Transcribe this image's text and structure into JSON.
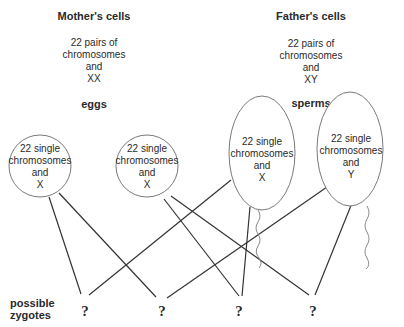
{
  "mother": {
    "title": "Mother's cells",
    "lines": [
      "22 pairs of",
      "chromosomes",
      "and",
      "XX"
    ],
    "gamete_label": "eggs"
  },
  "father": {
    "title": "Father's cells",
    "lines": [
      "22 pairs of",
      "chromosomes",
      "and",
      "XY"
    ],
    "gamete_label": "sperms"
  },
  "gametes": [
    {
      "kind": "egg",
      "lines": [
        "22 single",
        "chromosomes",
        "and",
        "X"
      ]
    },
    {
      "kind": "egg",
      "lines": [
        "22 single",
        "chromosomes",
        "and",
        "X"
      ]
    },
    {
      "kind": "sperm",
      "lines": [
        "22 single",
        "chromosomes",
        "and",
        "X"
      ]
    },
    {
      "kind": "sperm",
      "lines": [
        "22 single",
        "chromosomes",
        "and",
        "Y"
      ]
    }
  ],
  "zygotes": {
    "label_lines": [
      "possible",
      "zygotes"
    ],
    "items": [
      "?",
      "?",
      "?",
      "?"
    ]
  },
  "connections": [
    {
      "from": 0,
      "to": 0
    },
    {
      "from": 0,
      "to": 1
    },
    {
      "from": 1,
      "to": 2
    },
    {
      "from": 1,
      "to": 3
    },
    {
      "from": 2,
      "to": 0
    },
    {
      "from": 2,
      "to": 2
    },
    {
      "from": 3,
      "to": 1
    },
    {
      "from": 3,
      "to": 3
    }
  ],
  "colors": {
    "line": "#333333",
    "cell_outline": "#7a7a7a",
    "text": "#2a2a2a"
  }
}
